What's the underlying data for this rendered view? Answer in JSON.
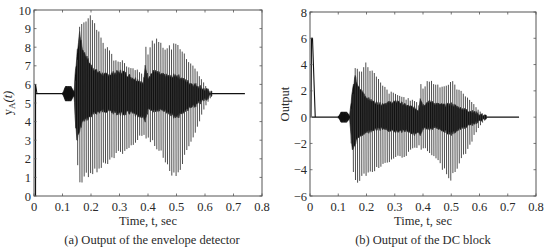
{
  "figure": {
    "captions": [
      "(a) Output of the envelope detector",
      "(b) Output of the DC block"
    ]
  },
  "chart_data": [
    {
      "type": "line",
      "title": "(a) Output of the envelope detector",
      "xlabel": "Time, t, sec",
      "ylabel": "y_A(t)",
      "ylabel_main": "y",
      "ylabel_sub": "A",
      "ylabel_arg": "(t)",
      "xlim": [
        0,
        0.8
      ],
      "ylim": [
        0,
        10
      ],
      "xticks": [
        0,
        0.1,
        0.2,
        0.3,
        0.4,
        0.5,
        0.6,
        0.7,
        0.8
      ],
      "xtick_labels": [
        "0",
        "0.1",
        "0.2",
        "0.3",
        "0.4",
        "0.5",
        "0.6",
        "0.7",
        "0.8"
      ],
      "yticks": [
        0,
        1,
        2,
        3,
        4,
        5,
        6,
        7,
        8,
        9,
        10
      ],
      "ytick_labels": [
        "0",
        "1",
        "2",
        "3",
        "4",
        "5",
        "6",
        "7",
        "8",
        "9",
        "10"
      ],
      "grid": false,
      "baseline": 5.5,
      "signal_end": 0.74,
      "initial_spike": {
        "t": 0.0,
        "from": 0,
        "to": 6.0
      },
      "envelope": {
        "t": [
          0.0,
          0.1,
          0.11,
          0.13,
          0.14,
          0.15,
          0.16,
          0.17,
          0.19,
          0.2,
          0.22,
          0.25,
          0.28,
          0.31,
          0.34,
          0.37,
          0.385,
          0.39,
          0.4,
          0.42,
          0.45,
          0.48,
          0.5,
          0.53,
          0.56,
          0.58,
          0.6,
          0.62,
          0.74
        ],
        "upper": [
          5.5,
          5.5,
          5.9,
          5.9,
          5.6,
          6.8,
          9.5,
          9.4,
          9.7,
          10.0,
          9.2,
          8.2,
          7.5,
          7.3,
          7.0,
          6.8,
          6.5,
          8.5,
          7.8,
          8.6,
          8.2,
          8.1,
          8.5,
          7.6,
          7.1,
          6.5,
          6.0,
          5.6,
          5.5
        ],
        "lower": [
          5.5,
          5.5,
          5.1,
          5.1,
          5.4,
          1.6,
          0.7,
          0.6,
          1.0,
          0.9,
          1.2,
          1.5,
          2.0,
          2.2,
          2.5,
          3.0,
          3.2,
          2.8,
          3.0,
          2.7,
          2.0,
          1.0,
          0.6,
          2.0,
          3.0,
          4.0,
          4.8,
          5.3,
          5.5
        ],
        "core_upper": [
          5.5,
          5.5,
          5.8,
          5.8,
          5.6,
          7.5,
          8.8,
          7.9,
          7.3,
          7.0,
          6.7,
          6.5,
          6.6,
          6.7,
          6.4,
          6.2,
          6.0,
          7.0,
          6.4,
          6.7,
          6.5,
          6.4,
          6.5,
          6.2,
          6.0,
          5.9,
          5.7,
          5.6,
          5.5
        ],
        "core_lower": [
          5.5,
          5.5,
          5.2,
          5.2,
          5.4,
          3.0,
          3.5,
          4.0,
          4.2,
          4.3,
          4.5,
          4.6,
          4.5,
          4.4,
          4.5,
          4.2,
          4.3,
          4.0,
          4.6,
          4.6,
          4.7,
          4.4,
          4.2,
          4.6,
          4.8,
          5.0,
          5.2,
          5.4,
          5.5
        ]
      },
      "pulse_period": 0.0075,
      "pulse_start": 0.145,
      "pulse_end": 0.62
    },
    {
      "type": "line",
      "title": "(b) Output of the DC block",
      "xlabel": "Time, t, sec",
      "ylabel": "Output",
      "xlim": [
        0,
        0.8
      ],
      "ylim": [
        -6,
        8
      ],
      "xticks": [
        0,
        0.1,
        0.2,
        0.3,
        0.4,
        0.5,
        0.6,
        0.7,
        0.8
      ],
      "xtick_labels": [
        "0",
        "0.1",
        "0.2",
        "0.3",
        "0.4",
        "0.5",
        "0.6",
        "0.7",
        "0.8"
      ],
      "yticks": [
        -6,
        -4,
        -2,
        0,
        2,
        4,
        6,
        8
      ],
      "ytick_labels": [
        "−6",
        "−4",
        "−2",
        "0",
        "2",
        "4",
        "6",
        "8"
      ],
      "grid": false,
      "baseline": 0,
      "signal_end": 0.74,
      "initial_spike": {
        "t": 0.0,
        "from": 0,
        "to": 6.0,
        "decay_to_t": 0.015
      },
      "envelope": {
        "t": [
          0.0,
          0.1,
          0.11,
          0.13,
          0.14,
          0.15,
          0.16,
          0.17,
          0.19,
          0.2,
          0.22,
          0.25,
          0.28,
          0.31,
          0.34,
          0.37,
          0.385,
          0.39,
          0.4,
          0.42,
          0.45,
          0.48,
          0.5,
          0.53,
          0.56,
          0.58,
          0.6,
          0.62,
          0.74
        ],
        "upper": [
          0.0,
          0.0,
          0.4,
          0.4,
          0.1,
          1.3,
          3.9,
          3.8,
          4.0,
          4.3,
          3.7,
          2.7,
          2.0,
          1.8,
          1.5,
          1.3,
          1.0,
          2.9,
          2.3,
          3.0,
          2.6,
          2.5,
          2.9,
          2.1,
          1.6,
          1.0,
          0.5,
          0.1,
          0.0
        ],
        "lower": [
          0.0,
          0.0,
          -0.4,
          -0.4,
          -0.1,
          -4.0,
          -4.8,
          -5.1,
          -4.6,
          -4.7,
          -4.3,
          -4.0,
          -3.5,
          -3.2,
          -3.0,
          -2.5,
          -2.3,
          -2.6,
          -2.5,
          -2.8,
          -3.5,
          -4.4,
          -4.9,
          -3.5,
          -2.5,
          -1.5,
          -0.7,
          -0.2,
          0.0
        ],
        "core_upper": [
          0.0,
          0.0,
          0.3,
          0.3,
          0.1,
          2.0,
          3.1,
          2.3,
          1.8,
          1.5,
          1.2,
          1.0,
          1.1,
          1.2,
          0.9,
          0.7,
          0.5,
          1.5,
          0.9,
          1.2,
          1.0,
          0.9,
          1.0,
          0.7,
          0.5,
          0.4,
          0.2,
          0.1,
          0.0
        ],
        "core_lower": [
          0.0,
          0.0,
          -0.3,
          -0.3,
          -0.1,
          -2.5,
          -2.0,
          -1.5,
          -1.3,
          -1.2,
          -1.0,
          -0.9,
          -1.0,
          -1.1,
          -1.0,
          -1.3,
          -1.2,
          -1.5,
          -0.9,
          -0.9,
          -0.8,
          -1.1,
          -1.3,
          -0.9,
          -0.7,
          -0.5,
          -0.3,
          -0.1,
          0.0
        ]
      },
      "pulse_period": 0.0075,
      "pulse_start": 0.145,
      "pulse_end": 0.62
    }
  ],
  "layout": {
    "panels": [
      {
        "x0": 34,
        "x1": 262,
        "y_top": 10,
        "y_bottom": 196
      },
      {
        "x0": 310,
        "x1": 536,
        "y_top": 12,
        "y_bottom": 196
      }
    ],
    "colors": {
      "axis": "#555555",
      "signal": "#111111",
      "signal_light": "#3a3a3a"
    }
  }
}
